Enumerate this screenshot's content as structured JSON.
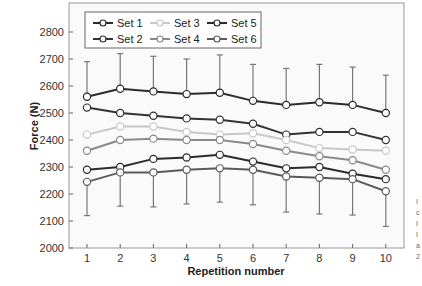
{
  "chart_data": {
    "type": "line",
    "title": "",
    "xlabel": "Repetition number",
    "ylabel": "Force (N)",
    "x": [
      1,
      2,
      3,
      4,
      5,
      6,
      7,
      8,
      9,
      10
    ],
    "xticks": [
      "1",
      "2",
      "3",
      "4",
      "5",
      "6",
      "7",
      "8",
      "9",
      "10"
    ],
    "yticks": [
      "2000",
      "2100",
      "2200",
      "2300",
      "2400",
      "2500",
      "2600",
      "2700",
      "2800"
    ],
    "ylim": [
      2000,
      2800
    ],
    "grid": false,
    "legend_position": "upper left",
    "series": [
      {
        "name": "Set 1",
        "color": "#2b2b2b",
        "values": [
          2290,
          2300,
          2330,
          2335,
          2345,
          2320,
          2295,
          2300,
          2275,
          2255
        ]
      },
      {
        "name": "Set 2",
        "color": "#333333",
        "values": [
          2520,
          2500,
          2490,
          2480,
          2475,
          2460,
          2420,
          2430,
          2430,
          2400
        ]
      },
      {
        "name": "Set 3",
        "color": "#c8c8c8",
        "values": [
          2420,
          2450,
          2450,
          2430,
          2420,
          2425,
          2400,
          2370,
          2365,
          2360
        ]
      },
      {
        "name": "Set 4",
        "color": "#8a8a8a",
        "values": [
          2360,
          2400,
          2405,
          2400,
          2400,
          2385,
          2360,
          2340,
          2325,
          2290
        ]
      },
      {
        "name": "Set 5",
        "color": "#2b2b2b",
        "values": [
          2560,
          2590,
          2580,
          2570,
          2575,
          2545,
          2530,
          2540,
          2530,
          2500
        ]
      },
      {
        "name": "Set 6",
        "color": "#5a5a5a",
        "values": [
          2245,
          2280,
          2280,
          2290,
          2295,
          2290,
          2265,
          2260,
          2255,
          2210
        ]
      }
    ],
    "error_bars": {
      "upper_on": "Set 5",
      "upper": [
        2690,
        2720,
        2710,
        2700,
        2715,
        2680,
        2665,
        2680,
        2670,
        2640
      ],
      "lower_on": "Set 6",
      "lower": [
        2120,
        2155,
        2152,
        2163,
        2170,
        2160,
        2133,
        2126,
        2122,
        2080
      ]
    }
  },
  "legend": {
    "items": [
      {
        "label": "Set 1"
      },
      {
        "label": "Set 3"
      },
      {
        "label": "Set 5"
      },
      {
        "label": "Set 2"
      },
      {
        "label": "Set 4"
      },
      {
        "label": "Set 6"
      }
    ]
  },
  "cropped_margin_text": [
    "I",
    "c",
    "I",
    "I",
    "a",
    "2"
  ]
}
